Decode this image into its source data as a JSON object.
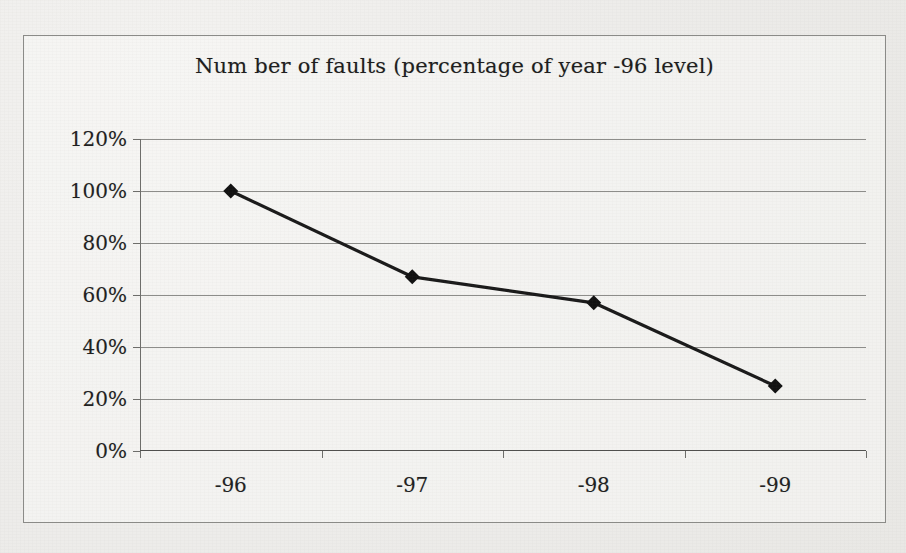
{
  "chart_data": {
    "type": "line",
    "title": "Num ber of faults (percentage of year -96 level)",
    "xlabel": "",
    "ylabel": "",
    "categories": [
      "-96",
      "-97",
      "-98",
      "-99"
    ],
    "values": [
      100,
      67,
      57,
      25
    ],
    "value_labels": [
      "100%",
      "67%",
      "57%",
      "25%"
    ],
    "ylim": [
      0,
      120
    ],
    "ytick_values": [
      0,
      20,
      40,
      60,
      80,
      100,
      120
    ],
    "ytick_labels": [
      "0%",
      "20%",
      "40%",
      "60%",
      "80%",
      "100%",
      "120%"
    ],
    "grid": "horizontal",
    "legend": "none",
    "marker": "diamond",
    "series": [
      {
        "name": "Number of faults",
        "values": [
          100,
          67,
          57,
          25
        ]
      }
    ],
    "colors": {
      "line": "#1a1a1a",
      "marker": "#111111",
      "gridline": "#8d8d8a",
      "axis": "#4f4f4d",
      "text": "#1f1f1f",
      "plot_background": "#f1f0ee",
      "frame_border": "#8b8b88"
    }
  }
}
